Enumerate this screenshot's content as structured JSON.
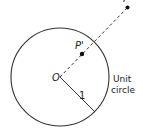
{
  "diagram": {
    "labels": {
      "origin": "O",
      "p_prime": "P'",
      "p": "P",
      "radius": "1",
      "caption_line1": "Unit",
      "caption_line2": "circle"
    },
    "geometry": {
      "circle_center": [
        60,
        77
      ],
      "circle_radius": 49,
      "radius_endpoint": [
        95,
        112
      ],
      "ray_end": [
        128,
        7
      ],
      "p_prime_point": [
        82,
        54
      ],
      "p_point": [
        128,
        7
      ]
    },
    "colors": {
      "stroke": "#333333",
      "point": "#111111"
    }
  }
}
